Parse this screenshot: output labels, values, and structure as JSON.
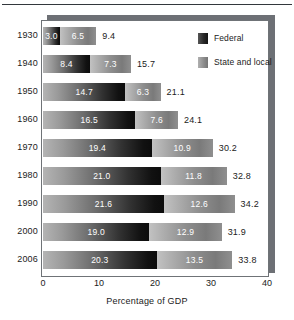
{
  "chart_data": {
    "type": "bar",
    "orientation": "horizontal",
    "stacked": true,
    "title": "",
    "xlabel": "Percentage of GDP",
    "ylabel": "",
    "xlim": [
      0,
      40
    ],
    "xticks": [
      0,
      10,
      20,
      30,
      40
    ],
    "xtick_labels": [
      "0",
      "10",
      "20",
      "30",
      "40"
    ],
    "grid": false,
    "legend_position": "top-right",
    "categories": [
      "1930",
      "1940",
      "1950",
      "1960",
      "1970",
      "1980",
      "1990",
      "2000",
      "2006"
    ],
    "series": [
      {
        "name": "Federal",
        "color": "#1b1b1b",
        "values": [
          3.0,
          8.4,
          14.7,
          16.5,
          19.4,
          21.0,
          21.6,
          19.0,
          20.3
        ],
        "labels": [
          "3.0",
          "8.4",
          "14.7",
          "16.5",
          "19.4",
          "21.0",
          "21.6",
          "19.0",
          "20.3"
        ]
      },
      {
        "name": "State and local",
        "color": "#8e8e8e",
        "values": [
          6.5,
          7.3,
          6.3,
          7.6,
          10.9,
          11.8,
          12.6,
          12.9,
          13.5
        ],
        "labels": [
          "6.5",
          "7.3",
          "6.3",
          "7.6",
          "10.9",
          "11.8",
          "12.6",
          "12.9",
          "13.5"
        ]
      }
    ],
    "totals": [
      9.4,
      15.7,
      21.1,
      24.1,
      30.2,
      32.8,
      34.2,
      31.9,
      33.8
    ],
    "total_labels": [
      "9.4",
      "15.7",
      "21.1",
      "24.1",
      "30.2",
      "32.8",
      "34.2",
      "31.9",
      "33.8"
    ]
  },
  "legend": {
    "items": [
      {
        "label": "Federal",
        "swatch": "federal-swatch"
      },
      {
        "label": "State and local",
        "swatch": "state-and-local-swatch"
      }
    ]
  },
  "axis": {
    "title": "Percentage of GDP",
    "ticks": [
      "0",
      "10",
      "20",
      "30",
      "40"
    ]
  }
}
